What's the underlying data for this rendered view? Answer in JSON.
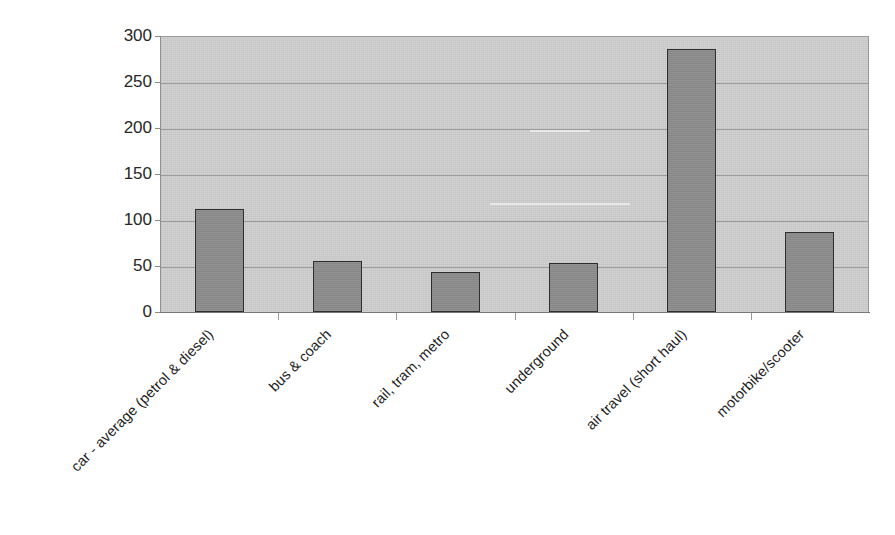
{
  "chart_data": {
    "type": "bar",
    "title": "",
    "subtitle": "",
    "xlabel": "",
    "ylabel": "",
    "categories": [
      "car - average (petrol & diesel)",
      "bus & coach",
      "rail, tram, metro",
      "underground",
      "air travel (short haul)",
      "motorbike/scooter"
    ],
    "values": [
      112,
      55,
      43,
      53,
      286,
      87
    ],
    "ylim": [
      0,
      300
    ],
    "ytick_labels": [
      "300",
      "250",
      "200",
      "150",
      "100",
      "50",
      "0"
    ],
    "ytick_values": [
      300,
      250,
      200,
      150,
      100,
      50,
      0
    ],
    "grid": true,
    "grid_axis": "y",
    "legend": false,
    "legend_position": "none",
    "bar_fill_color": "#8c8c8c",
    "bar_border_color": "#2e2e2e",
    "plot_background_color": "#cfcfcf",
    "gridline_color": "#9d9d9d",
    "axis_color": "#7c7c7c",
    "label_color": "#1d1d1d",
    "label_rotation_degrees": -45
  }
}
